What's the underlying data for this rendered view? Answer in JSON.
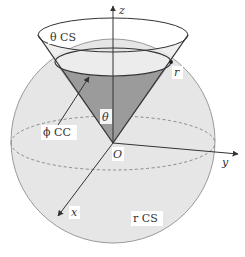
{
  "diagram": {
    "type": "spherical coordinate surfaces",
    "colors": {
      "sphere_fill": "#e6e6e6",
      "sphere_stroke": "#9a9a9a",
      "cone_fill": "#9b9b9b",
      "line": "#333333",
      "equator_dash": "#8a8a8a",
      "label_bg": "#ffffff"
    },
    "axes": {
      "z": "z",
      "y": "y",
      "x": "x",
      "origin": "O"
    },
    "labels": {
      "theta_surface": "θ CS",
      "r_point": "r",
      "theta_angle": "θ",
      "phi_curve": "ϕ CC",
      "r_surface": "r CS"
    }
  }
}
